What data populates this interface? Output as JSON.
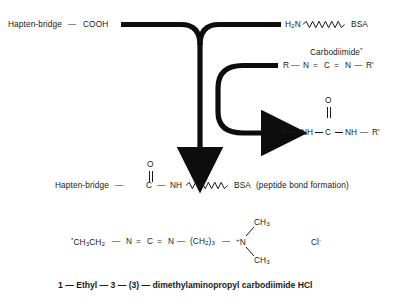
{
  "diagram": {
    "title_caption": "1 — Ethyl — 3 — (3) — dimethylaminopropyl carbodiimide HCl",
    "reactants": {
      "hapten": "Hapten-bridge",
      "hapten_bond_dash": "—",
      "hapten_group": "COOH",
      "amine_label_h": "H",
      "amine_label_2": "2",
      "amine_label_n": "N",
      "carrier": "BSA"
    },
    "reagent": {
      "name": "Carbodiimide",
      "asterisk": "*",
      "r_left": "R",
      "dash1": "—",
      "n_left": "N",
      "eq1": "=",
      "c_center": "C",
      "eq2": "=",
      "n_right": "N",
      "dash2": "—",
      "r_right": "R'"
    },
    "byproduct": {
      "o_atom": "O",
      "double_bond": "||",
      "r_left": "R",
      "dash1": "—",
      "nh_left": "NH",
      "c_center": "C",
      "nh_right": "NH",
      "dash2": "—",
      "r_right": "R'"
    },
    "product": {
      "hapten": "Hapten-bridge",
      "dash1": "—",
      "c_atom": "C",
      "o_atom": "O",
      "double_bond": "||",
      "dash2": "—",
      "nh": "NH",
      "carrier": "BSA",
      "note": "(peptide bond formation)"
    },
    "edc_structure": {
      "ethyl_star": "*",
      "ethyl_ch": "CH",
      "ethyl_3": "3",
      "ethyl_ch2": "CH",
      "ethyl_2": "2",
      "dash1": "—",
      "n_left": "N",
      "eq1": "=",
      "c_center": "C",
      "eq2": "=",
      "n_right": "N",
      "dash2": "—",
      "propyl": "(CH",
      "propyl_sub": "2",
      "propyl_close": ")",
      "propyl_n": "3",
      "dash3": "—",
      "n_plus_sup": "+",
      "n_plus": "N",
      "methyl_top": "CH",
      "methyl_top_sub": "3",
      "methyl_bottom": "CH",
      "methyl_bottom_sub": "3",
      "chloride": "Cl",
      "chloride_charge": "-"
    },
    "colors": {
      "ink": "#1a1a1a",
      "background": "#ffffff"
    }
  }
}
